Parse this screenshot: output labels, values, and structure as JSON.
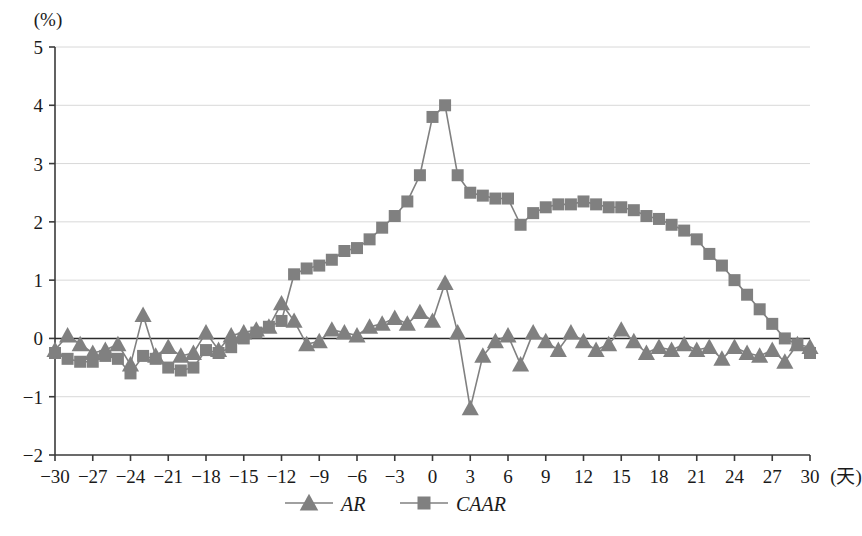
{
  "chart_data": {
    "type": "line",
    "title": "",
    "xlabel": "(天)",
    "ylabel": "(%)",
    "xlim": [
      -30,
      30
    ],
    "ylim": [
      -2,
      5
    ],
    "xticks": [
      -30,
      -27,
      -24,
      -21,
      -18,
      -15,
      -12,
      -9,
      -6,
      -3,
      0,
      3,
      6,
      9,
      12,
      15,
      18,
      21,
      24,
      27,
      30
    ],
    "yticks": [
      -2,
      -1,
      0,
      1,
      2,
      3,
      4,
      5
    ],
    "grid": true,
    "grid_axis": "y",
    "legend_position": "bottom-center",
    "zero_line": true,
    "x": [
      -30,
      -29,
      -28,
      -27,
      -26,
      -25,
      -24,
      -23,
      -22,
      -21,
      -20,
      -19,
      -18,
      -17,
      -16,
      -15,
      -14,
      -13,
      -12,
      -11,
      -10,
      -9,
      -8,
      -7,
      -6,
      -5,
      -4,
      -3,
      -2,
      -1,
      0,
      1,
      2,
      3,
      4,
      5,
      6,
      7,
      8,
      9,
      10,
      11,
      12,
      13,
      14,
      15,
      16,
      17,
      18,
      19,
      20,
      21,
      22,
      23,
      24,
      25,
      26,
      27,
      28,
      29,
      30
    ],
    "series": [
      {
        "name": "AR",
        "marker": "triangle",
        "color": "#808080",
        "values": [
          -0.2,
          0.05,
          -0.1,
          -0.25,
          -0.2,
          -0.1,
          -0.45,
          0.4,
          -0.3,
          -0.15,
          -0.3,
          -0.25,
          0.1,
          -0.2,
          0.05,
          0.1,
          0.15,
          0.2,
          0.6,
          0.3,
          -0.1,
          -0.05,
          0.15,
          0.1,
          0.05,
          0.2,
          0.25,
          0.35,
          0.25,
          0.45,
          0.3,
          0.95,
          0.1,
          -1.2,
          -0.3,
          -0.05,
          0.05,
          -0.45,
          0.1,
          -0.05,
          -0.2,
          0.1,
          -0.05,
          -0.2,
          -0.1,
          0.15,
          -0.05,
          -0.25,
          -0.15,
          -0.2,
          -0.1,
          -0.2,
          -0.15,
          -0.35,
          -0.15,
          -0.25,
          -0.3,
          -0.2,
          -0.4,
          -0.1,
          -0.15
        ]
      },
      {
        "name": "CAAR",
        "marker": "square",
        "color": "#808080",
        "values": [
          -0.25,
          -0.35,
          -0.4,
          -0.4,
          -0.3,
          -0.35,
          -0.6,
          -0.3,
          -0.35,
          -0.5,
          -0.55,
          -0.5,
          -0.2,
          -0.25,
          -0.15,
          0.0,
          0.1,
          0.2,
          0.3,
          1.1,
          1.2,
          1.25,
          1.35,
          1.5,
          1.55,
          1.7,
          1.9,
          2.1,
          2.35,
          2.8,
          3.8,
          4.0,
          2.8,
          2.5,
          2.45,
          2.4,
          2.4,
          1.95,
          2.15,
          2.25,
          2.3,
          2.3,
          2.35,
          2.3,
          2.25,
          2.25,
          2.2,
          2.1,
          2.05,
          1.95,
          1.85,
          1.7,
          1.45,
          1.25,
          1.0,
          0.75,
          0.5,
          0.25,
          0.0,
          -0.1,
          -0.25
        ]
      }
    ]
  }
}
